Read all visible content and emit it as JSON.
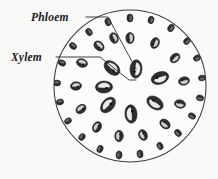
{
  "figure": {
    "background_color": "#f9f9f7",
    "outline_color": "#3a3a3a",
    "leader_color": "#2b2b2b"
  },
  "labels": [
    {
      "id": "phloem",
      "text": "Phloem",
      "x": 31,
      "y": 21,
      "leader_points": "86,17 108,17 136,69",
      "target": "vascular-bundle-phloem"
    },
    {
      "id": "xylem",
      "text": "Xylem",
      "x": 11,
      "y": 61,
      "leader_points": "56,57 100,57 129,80 136,80",
      "target": "vascular-bundle-xylem"
    }
  ],
  "stem": {
    "center_x": 130,
    "center_y": 86,
    "radius": 76,
    "fill": "#fcfcfa"
  },
  "bundle_colors": {
    "dark": "#2e2e2e",
    "mid": "#6d6d6d",
    "light": "#cfcfcf",
    "pale": "#eaeaea",
    "outline": "#1f1f1f"
  },
  "chart_data": {
    "type": "scatter",
    "xlabel": "",
    "ylabel": "",
    "note": "Scattered vascular bundles in ground tissue; bundle size increases toward the centre.",
    "categories": [
      "vascular bundle"
    ],
    "bundles": [
      {
        "cx": 130,
        "cy": 18,
        "rx": 3.1,
        "ry": 4.0,
        "rot": 0,
        "tone": "dark",
        "ring": 1
      },
      {
        "cx": 151,
        "cy": 20,
        "rx": 2.9,
        "ry": 3.8,
        "rot": 14,
        "tone": "dark",
        "ring": 1
      },
      {
        "cx": 171,
        "cy": 28,
        "rx": 3.0,
        "ry": 3.9,
        "rot": 28,
        "tone": "dark",
        "ring": 1
      },
      {
        "cx": 187,
        "cy": 41,
        "rx": 2.9,
        "ry": 3.8,
        "rot": 44,
        "tone": "dark",
        "ring": 1
      },
      {
        "cx": 197,
        "cy": 58,
        "rx": 2.9,
        "ry": 3.7,
        "rot": 62,
        "tone": "dark",
        "ring": 1
      },
      {
        "cx": 202,
        "cy": 78,
        "rx": 2.8,
        "ry": 3.6,
        "rot": 80,
        "tone": "dark",
        "ring": 1
      },
      {
        "cx": 200,
        "cy": 98,
        "rx": 2.9,
        "ry": 3.7,
        "rot": 100,
        "tone": "dark",
        "ring": 1
      },
      {
        "cx": 192,
        "cy": 116,
        "rx": 2.9,
        "ry": 3.8,
        "rot": 118,
        "tone": "dark",
        "ring": 1
      },
      {
        "cx": 178,
        "cy": 133,
        "rx": 3.0,
        "ry": 3.9,
        "rot": 136,
        "tone": "dark",
        "ring": 1
      },
      {
        "cx": 160,
        "cy": 146,
        "rx": 2.9,
        "ry": 3.8,
        "rot": 152,
        "tone": "dark",
        "ring": 1
      },
      {
        "cx": 140,
        "cy": 154,
        "rx": 3.0,
        "ry": 3.9,
        "rot": 168,
        "tone": "dark",
        "ring": 1
      },
      {
        "cx": 119,
        "cy": 155,
        "rx": 3.0,
        "ry": 3.9,
        "rot": 186,
        "tone": "dark",
        "ring": 1
      },
      {
        "cx": 100,
        "cy": 149,
        "rx": 2.9,
        "ry": 3.8,
        "rot": 202,
        "tone": "dark",
        "ring": 1
      },
      {
        "cx": 82,
        "cy": 137,
        "rx": 2.9,
        "ry": 3.7,
        "rot": 218,
        "tone": "dark",
        "ring": 1
      },
      {
        "cx": 68,
        "cy": 121,
        "rx": 2.8,
        "ry": 3.6,
        "rot": 236,
        "tone": "dark",
        "ring": 1
      },
      {
        "cx": 60,
        "cy": 102,
        "rx": 2.9,
        "ry": 3.7,
        "rot": 256,
        "tone": "dark",
        "ring": 1
      },
      {
        "cx": 57,
        "cy": 83,
        "rx": 2.9,
        "ry": 3.7,
        "rot": 274,
        "tone": "dark",
        "ring": 1
      },
      {
        "cx": 62,
        "cy": 63,
        "rx": 2.9,
        "ry": 3.8,
        "rot": 292,
        "tone": "dark",
        "ring": 1
      },
      {
        "cx": 73,
        "cy": 46,
        "rx": 3.0,
        "ry": 3.9,
        "rot": 310,
        "tone": "dark",
        "ring": 1
      },
      {
        "cx": 89,
        "cy": 32,
        "rx": 3.0,
        "ry": 3.9,
        "rot": 328,
        "tone": "dark",
        "ring": 1
      },
      {
        "cx": 108,
        "cy": 22,
        "rx": 3.0,
        "ry": 3.9,
        "rot": 344,
        "tone": "dark",
        "ring": 1
      },
      {
        "cx": 130,
        "cy": 38,
        "rx": 4.2,
        "ry": 5.6,
        "rot": 0,
        "tone": "mid",
        "ring": 2
      },
      {
        "cx": 155,
        "cy": 43,
        "rx": 4.2,
        "ry": 5.6,
        "rot": 24,
        "tone": "mid",
        "ring": 2
      },
      {
        "cx": 175,
        "cy": 58,
        "rx": 4.1,
        "ry": 5.5,
        "rot": 48,
        "tone": "mid",
        "ring": 2
      },
      {
        "cx": 184,
        "cy": 81,
        "rx": 4.2,
        "ry": 5.5,
        "rot": 78,
        "tone": "mid",
        "ring": 2
      },
      {
        "cx": 180,
        "cy": 104,
        "rx": 4.2,
        "ry": 5.6,
        "rot": 104,
        "tone": "mid",
        "ring": 2
      },
      {
        "cx": 165,
        "cy": 124,
        "rx": 4.3,
        "ry": 5.7,
        "rot": 130,
        "tone": "mid",
        "ring": 2
      },
      {
        "cx": 143,
        "cy": 135,
        "rx": 4.2,
        "ry": 5.6,
        "rot": 156,
        "tone": "mid",
        "ring": 2
      },
      {
        "cx": 119,
        "cy": 136,
        "rx": 4.3,
        "ry": 5.7,
        "rot": 184,
        "tone": "mid",
        "ring": 2
      },
      {
        "cx": 97,
        "cy": 127,
        "rx": 4.2,
        "ry": 5.6,
        "rot": 208,
        "tone": "mid",
        "ring": 2
      },
      {
        "cx": 81,
        "cy": 109,
        "rx": 4.1,
        "ry": 5.5,
        "rot": 234,
        "tone": "mid",
        "ring": 2
      },
      {
        "cx": 76,
        "cy": 86,
        "rx": 4.2,
        "ry": 5.5,
        "rot": 262,
        "tone": "mid",
        "ring": 2
      },
      {
        "cx": 82,
        "cy": 63,
        "rx": 4.2,
        "ry": 5.6,
        "rot": 288,
        "tone": "mid",
        "ring": 2
      },
      {
        "cx": 99,
        "cy": 46,
        "rx": 4.3,
        "ry": 5.7,
        "rot": 314,
        "tone": "mid",
        "ring": 2
      },
      {
        "cx": 114,
        "cy": 38,
        "rx": 4.1,
        "ry": 5.5,
        "rot": 338,
        "tone": "mid",
        "ring": 2
      },
      {
        "cx": 136,
        "cy": 69,
        "rx": 6.0,
        "ry": 9.2,
        "rot": 4,
        "tone": "light",
        "ring": 3
      },
      {
        "cx": 160,
        "cy": 78,
        "rx": 6.1,
        "ry": 9.0,
        "rot": 70,
        "tone": "light",
        "ring": 3
      },
      {
        "cx": 155,
        "cy": 103,
        "rx": 6.0,
        "ry": 9.0,
        "rot": 124,
        "tone": "light",
        "ring": 3
      },
      {
        "cx": 131,
        "cy": 114,
        "rx": 6.1,
        "ry": 9.2,
        "rot": 176,
        "tone": "light",
        "ring": 3
      },
      {
        "cx": 108,
        "cy": 105,
        "rx": 6.0,
        "ry": 9.0,
        "rot": 222,
        "tone": "light",
        "ring": 3
      },
      {
        "cx": 104,
        "cy": 87,
        "rx": 6.0,
        "ry": 8.6,
        "rot": 268,
        "tone": "light",
        "ring": 3
      },
      {
        "cx": 112,
        "cy": 68,
        "rx": 6.0,
        "ry": 9.0,
        "rot": 310,
        "tone": "light",
        "ring": 3
      }
    ]
  }
}
